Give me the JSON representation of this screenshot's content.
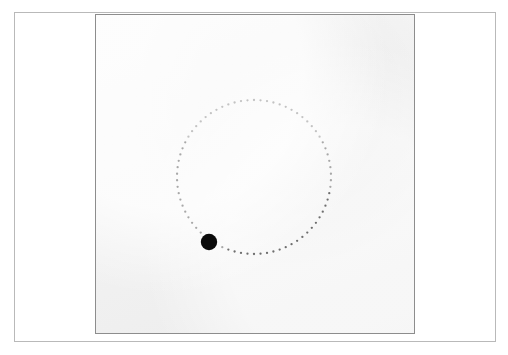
{
  "figure": {
    "background_color": "#ffffff",
    "outer_frame": {
      "name": "figure-border",
      "x": 14,
      "y": 12,
      "width": 482,
      "height": 330,
      "stroke_color": "#b9b9b9"
    },
    "panel": {
      "name": "simulation-panel",
      "x": 95,
      "y": 14,
      "width": 320,
      "height": 320,
      "background_color": "#efefef",
      "border_color": "#8d8d8d"
    }
  },
  "scene": {
    "orbit": {
      "label": "dotted-circular-trajectory",
      "center_x": 254,
      "center_y": 177,
      "radius": 77,
      "dot_count": 74,
      "dot_radius": 1.15,
      "color_light": "#c3c3c3",
      "color_mid": "#a8a8a8",
      "color_dark": "#6e6e6e"
    },
    "particle": {
      "label": "orbiting-particle",
      "center_x": 209,
      "center_y": 242,
      "radius": 8.2,
      "color": "#0a0a0a",
      "angle_degrees": 213
    }
  },
  "chart_data": {
    "type": "scatter",
    "title": "",
    "xlabel": "",
    "ylabel": "",
    "xlim": [
      95,
      415
    ],
    "ylim": [
      14,
      334
    ],
    "grid": false,
    "legend": null,
    "series": [
      {
        "name": "orbit path",
        "marker": "dot",
        "center": [
          254,
          177
        ],
        "radius": 77,
        "n_points": 74,
        "color": "#9a9a9a"
      },
      {
        "name": "particle",
        "marker": "filled-circle",
        "x": [
          209
        ],
        "y": [
          242
        ],
        "size": 16.4,
        "color": "#0a0a0a"
      }
    ],
    "annotations": []
  }
}
